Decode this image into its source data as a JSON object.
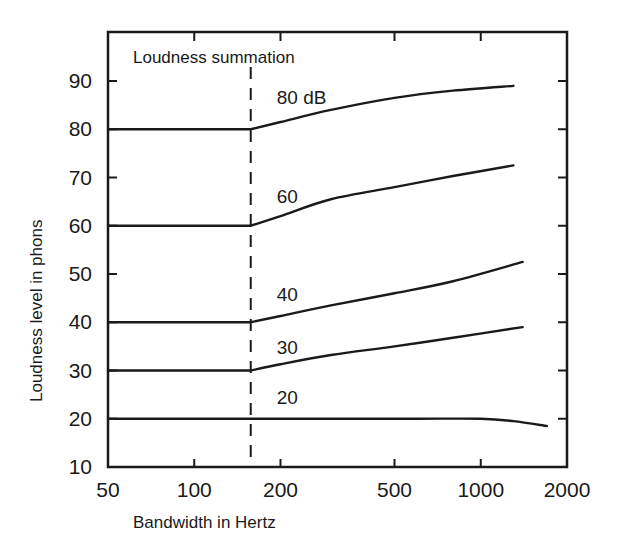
{
  "chart_data": {
    "type": "line",
    "title": "Loudness summation",
    "xlabel": "Bandwidth in Hertz",
    "ylabel": "Loudness level in phons",
    "xscale": "log",
    "xlim": [
      50,
      2000
    ],
    "ylim": [
      10,
      95
    ],
    "xticks": [
      50,
      100,
      200,
      500,
      1000,
      2000
    ],
    "xtick_labels": [
      "50",
      "100",
      "200",
      "500",
      "1000",
      "2000"
    ],
    "yticks": [
      10,
      20,
      30,
      40,
      50,
      60,
      70,
      80,
      90
    ],
    "ytick_labels": [
      "10",
      "20",
      "30",
      "40",
      "50",
      "60",
      "70",
      "80",
      "90"
    ],
    "grid": false,
    "critical_band_hz": 160,
    "colors": {
      "line": "#1a1a1a",
      "background": "#ffffff"
    },
    "series": [
      {
        "name": "80 dB",
        "label": "80 dB",
        "x": [
          50,
          160,
          200,
          300,
          500,
          800,
          1300
        ],
        "y": [
          80,
          80,
          81.5,
          84,
          86.5,
          88,
          89
        ]
      },
      {
        "name": "60 dB",
        "label": "60",
        "x": [
          50,
          160,
          200,
          300,
          500,
          800,
          1300
        ],
        "y": [
          60,
          60,
          62,
          65.5,
          68,
          70.3,
          72.5
        ]
      },
      {
        "name": "40 dB",
        "label": "40",
        "x": [
          50,
          160,
          200,
          300,
          500,
          800,
          1400
        ],
        "y": [
          40,
          40,
          41.3,
          43.5,
          46,
          48.5,
          52.5
        ]
      },
      {
        "name": "30 dB",
        "label": "30",
        "x": [
          50,
          160,
          200,
          300,
          500,
          800,
          1400
        ],
        "y": [
          30,
          30,
          31.3,
          33.2,
          35,
          36.8,
          39
        ]
      },
      {
        "name": "20 dB",
        "label": "20",
        "x": [
          50,
          160,
          300,
          600,
          1000,
          1300,
          1700
        ],
        "y": [
          20,
          20,
          20,
          20,
          20,
          19.5,
          18.5
        ]
      }
    ]
  }
}
